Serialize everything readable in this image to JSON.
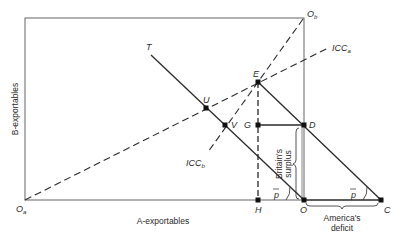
{
  "diagram": {
    "axes": {
      "x_label": "A-exportables",
      "y_label": "B-exportables"
    },
    "origins": {
      "a": "O",
      "a_sub": "a",
      "b": "O",
      "b_sub": "b"
    },
    "curves": {
      "icc_a": "ICC",
      "icc_a_sub": "a",
      "icc_b": "ICC",
      "icc_b_sub": "b",
      "trade_line": "T"
    },
    "points": {
      "E": "E",
      "U": "U",
      "V": "V",
      "G": "G",
      "D": "D",
      "H": "H",
      "O": "O",
      "C": "C"
    },
    "angles": {
      "p_left": "p",
      "p_right": "p"
    },
    "annotations": {
      "britain_line1": "Britain's",
      "britain_line2": "surplus",
      "america_line1": "America's",
      "america_line2": "deficit"
    },
    "colors": {
      "ink": "#2a2a2a",
      "frame": "#555555"
    }
  }
}
